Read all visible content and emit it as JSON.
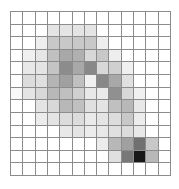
{
  "chart_data": {
    "type": "heatmap",
    "title": "",
    "xlabel": "",
    "ylabel": "",
    "rows": 13,
    "cols": 13,
    "grid": true,
    "colormap": "grayscale (white = low, black = high)",
    "values": [
      [
        0,
        0,
        0,
        0,
        0,
        0,
        0,
        0,
        0,
        0,
        0,
        0,
        0
      ],
      [
        0,
        0,
        0,
        11,
        11,
        11,
        11,
        0,
        0,
        0,
        0,
        0,
        0
      ],
      [
        0,
        0,
        7,
        22,
        22,
        22,
        22,
        7,
        0,
        0,
        0,
        0,
        0
      ],
      [
        0,
        6,
        10,
        25,
        34,
        31,
        15,
        22,
        7,
        0,
        0,
        0,
        0
      ],
      [
        0,
        9,
        11,
        23,
        45,
        34,
        47,
        15,
        19,
        6,
        0,
        0,
        0
      ],
      [
        0,
        14,
        12,
        29,
        37,
        25,
        6,
        47,
        34,
        12,
        0,
        0,
        0
      ],
      [
        3,
        11,
        15,
        28,
        25,
        19,
        9,
        8,
        44,
        15,
        6,
        0,
        0
      ],
      [
        0,
        0,
        11,
        15,
        28,
        25,
        12,
        11,
        25,
        28,
        9,
        0,
        0
      ],
      [
        0,
        0,
        7,
        11,
        14,
        14,
        8,
        11,
        14,
        22,
        7,
        0,
        0
      ],
      [
        0,
        0,
        0,
        0,
        9,
        11,
        7,
        9,
        12,
        14,
        9,
        0,
        0
      ],
      [
        0,
        0,
        0,
        0,
        0,
        0,
        0,
        7,
        28,
        37,
        56,
        22,
        0
      ],
      [
        0,
        0,
        0,
        0,
        0,
        0,
        0,
        0,
        12,
        53,
        91,
        28,
        0
      ],
      [
        0,
        0,
        0,
        0,
        0,
        0,
        0,
        0,
        0,
        0,
        0,
        0,
        0
      ]
    ],
    "value_range": [
      0,
      100
    ],
    "colors": [
      [
        "#ffffff",
        "#ffffff",
        "#ffffff",
        "#ffffff",
        "#ffffff",
        "#ffffff",
        "#ffffff",
        "#ffffff",
        "#ffffff",
        "#ffffff",
        "#ffffff",
        "#ffffff",
        "#ffffff"
      ],
      [
        "#ffffff",
        "#ffffff",
        "#ffffff",
        "#e4e4e4",
        "#e4e4e4",
        "#e4e4e4",
        "#e4e4e4",
        "#ffffff",
        "#ffffff",
        "#ffffff",
        "#ffffff",
        "#ffffff",
        "#ffffff"
      ],
      [
        "#ffffff",
        "#ffffff",
        "#eeeeee",
        "#c8c8c8",
        "#c8c8c8",
        "#c8c8c8",
        "#c8c8c8",
        "#eeeeee",
        "#ffffff",
        "#ffffff",
        "#ffffff",
        "#ffffff",
        "#ffffff"
      ],
      [
        "#ffffff",
        "#f0f0f0",
        "#e6e6e6",
        "#c0c0c0",
        "#a8a8a8",
        "#b0b0b0",
        "#d8d8d8",
        "#c8c8c8",
        "#eeeeee",
        "#ffffff",
        "#ffffff",
        "#ffffff",
        "#ffffff"
      ],
      [
        "#ffffff",
        "#e8e8e8",
        "#e4e4e4",
        "#c4c4c4",
        "#8c8c8c",
        "#a8a8a8",
        "#888888",
        "#d8d8d8",
        "#d0d0d0",
        "#f0f0f0",
        "#ffffff",
        "#ffffff",
        "#ffffff"
      ],
      [
        "#ffffff",
        "#dcdcdc",
        "#e0e0e0",
        "#b4b4b4",
        "#a0a0a0",
        "#c0c0c0",
        "#f0f0f0",
        "#888888",
        "#a8a8a8",
        "#e0e0e0",
        "#ffffff",
        "#ffffff",
        "#ffffff"
      ],
      [
        "#f8f8f8",
        "#e4e4e4",
        "#d8d8d8",
        "#b8b8b8",
        "#c0c0c0",
        "#d0d0d0",
        "#e8e8e8",
        "#eaeaea",
        "#909090",
        "#d8d8d8",
        "#f0f0f0",
        "#ffffff",
        "#ffffff"
      ],
      [
        "#ffffff",
        "#ffffff",
        "#e4e4e4",
        "#d8d8d8",
        "#b8b8b8",
        "#c0c0c0",
        "#e0e0e0",
        "#e4e4e4",
        "#c0c0c0",
        "#b8b8b8",
        "#e8e8e8",
        "#ffffff",
        "#ffffff"
      ],
      [
        "#ffffff",
        "#ffffff",
        "#ececec",
        "#e4e4e4",
        "#dcdcdc",
        "#dcdcdc",
        "#eaeaea",
        "#e4e4e4",
        "#dcdcdc",
        "#c8c8c8",
        "#ececec",
        "#ffffff",
        "#ffffff"
      ],
      [
        "#ffffff",
        "#ffffff",
        "#ffffff",
        "#ffffff",
        "#e8e8e8",
        "#e4e4e4",
        "#ececec",
        "#e8e8e8",
        "#e0e0e0",
        "#dcdcdc",
        "#e8e8e8",
        "#ffffff",
        "#ffffff"
      ],
      [
        "#ffffff",
        "#ffffff",
        "#ffffff",
        "#ffffff",
        "#ffffff",
        "#ffffff",
        "#ffffff",
        "#ececec",
        "#b8b8b8",
        "#a0a0a0",
        "#707070",
        "#c8c8c8",
        "#ffffff"
      ],
      [
        "#ffffff",
        "#ffffff",
        "#ffffff",
        "#ffffff",
        "#ffffff",
        "#ffffff",
        "#ffffff",
        "#ffffff",
        "#e0e0e0",
        "#787878",
        "#181818",
        "#b8b8b8",
        "#ffffff"
      ],
      [
        "#ffffff",
        "#ffffff",
        "#ffffff",
        "#ffffff",
        "#ffffff",
        "#ffffff",
        "#ffffff",
        "#ffffff",
        "#ffffff",
        "#ffffff",
        "#ffffff",
        "#ffffff",
        "#ffffff"
      ]
    ],
    "grid_line_color": "#8c8c8c"
  }
}
